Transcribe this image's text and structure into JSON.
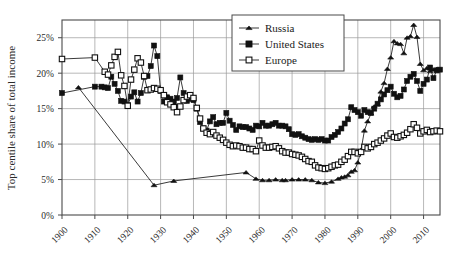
{
  "chart_data": {
    "type": "line",
    "title": "",
    "xlabel": "",
    "ylabel": "Top centile share of total income",
    "xlim": [
      1900,
      2015
    ],
    "ylim": [
      0,
      27.5
    ],
    "grid": true,
    "legend_position": "top-center-right",
    "x_tick_labels": [
      "1900",
      "1910",
      "1920",
      "1930",
      "1940",
      "1950",
      "1960",
      "1970",
      "1980",
      "1990",
      "2000",
      "2010"
    ],
    "x_ticks": [
      1900,
      1910,
      1920,
      1930,
      1940,
      1950,
      1960,
      1970,
      1980,
      1990,
      2000,
      2010
    ],
    "y_tick_labels": [
      "0%",
      "5%",
      "10%",
      "15%",
      "20%",
      "25%"
    ],
    "y_ticks": [
      0,
      5,
      10,
      15,
      20,
      25
    ],
    "series": [
      {
        "name": "Russia",
        "marker": "filled-triangle",
        "points": [
          [
            1905,
            18.0
          ],
          [
            1928,
            4.2
          ],
          [
            1934,
            4.8
          ],
          [
            1956,
            6.0
          ],
          [
            1959,
            5.1
          ],
          [
            1961,
            4.9
          ],
          [
            1963,
            4.9
          ],
          [
            1965,
            5.0
          ],
          [
            1967,
            4.9
          ],
          [
            1968,
            4.9
          ],
          [
            1970,
            5.0
          ],
          [
            1972,
            5.0
          ],
          [
            1974,
            5.0
          ],
          [
            1976,
            4.9
          ],
          [
            1978,
            4.6
          ],
          [
            1980,
            4.5
          ],
          [
            1982,
            4.7
          ],
          [
            1984,
            5.1
          ],
          [
            1985,
            5.3
          ],
          [
            1986,
            5.4
          ],
          [
            1987,
            5.6
          ],
          [
            1988,
            6.1
          ],
          [
            1989,
            6.3
          ],
          [
            1990,
            7.4
          ],
          [
            1991,
            9.2
          ],
          [
            1992,
            11.9
          ],
          [
            1993,
            13.2
          ],
          [
            1994,
            14.3
          ],
          [
            1995,
            15.3
          ],
          [
            1996,
            15.6
          ],
          [
            1997,
            17.4
          ],
          [
            1998,
            18.6
          ],
          [
            1999,
            20.6
          ],
          [
            2000,
            22.2
          ],
          [
            2001,
            24.5
          ],
          [
            2002,
            24.2
          ],
          [
            2003,
            24.1
          ],
          [
            2004,
            22.8
          ],
          [
            2005,
            25.0
          ],
          [
            2006,
            25.2
          ],
          [
            2007,
            26.8
          ],
          [
            2008,
            25.1
          ],
          [
            2009,
            21.3
          ],
          [
            2010,
            20.4
          ],
          [
            2011,
            20.7
          ],
          [
            2012,
            20.3
          ],
          [
            2013,
            20.5
          ],
          [
            2014,
            20.6
          ]
        ]
      },
      {
        "name": "United States",
        "marker": "filled-square",
        "points": [
          [
            1900,
            17.2
          ],
          [
            1910,
            18.1
          ],
          [
            1912,
            18.1
          ],
          [
            1913,
            18.0
          ],
          [
            1914,
            17.9
          ],
          [
            1915,
            19.5
          ],
          [
            1916,
            18.5
          ],
          [
            1917,
            17.5
          ],
          [
            1918,
            16.1
          ],
          [
            1919,
            16.0
          ],
          [
            1920,
            15.5
          ],
          [
            1921,
            16.7
          ],
          [
            1922,
            17.3
          ],
          [
            1923,
            16.0
          ],
          [
            1924,
            17.2
          ],
          [
            1925,
            19.5
          ],
          [
            1926,
            19.6
          ],
          [
            1927,
            21.0
          ],
          [
            1928,
            23.9
          ],
          [
            1929,
            22.4
          ],
          [
            1930,
            17.5
          ],
          [
            1931,
            16.0
          ],
          [
            1932,
            16.6
          ],
          [
            1933,
            16.4
          ],
          [
            1934,
            16.0
          ],
          [
            1935,
            16.5
          ],
          [
            1936,
            19.4
          ],
          [
            1937,
            17.2
          ],
          [
            1938,
            16.1
          ],
          [
            1939,
            16.4
          ],
          [
            1940,
            16.2
          ],
          [
            1941,
            15.0
          ],
          [
            1942,
            13.1
          ],
          [
            1943,
            12.2
          ],
          [
            1944,
            11.9
          ],
          [
            1945,
            13.2
          ],
          [
            1946,
            13.8
          ],
          [
            1947,
            12.8
          ],
          [
            1948,
            13.0
          ],
          [
            1949,
            13.0
          ],
          [
            1950,
            14.4
          ],
          [
            1951,
            13.3
          ],
          [
            1952,
            12.7
          ],
          [
            1953,
            12.0
          ],
          [
            1954,
            12.5
          ],
          [
            1955,
            12.4
          ],
          [
            1956,
            12.4
          ],
          [
            1957,
            12.2
          ],
          [
            1958,
            12.0
          ],
          [
            1959,
            12.6
          ],
          [
            1960,
            12.5
          ],
          [
            1961,
            13.0
          ],
          [
            1962,
            12.6
          ],
          [
            1963,
            12.6
          ],
          [
            1964,
            12.8
          ],
          [
            1965,
            13.0
          ],
          [
            1966,
            12.6
          ],
          [
            1967,
            12.6
          ],
          [
            1968,
            12.5
          ],
          [
            1969,
            12.1
          ],
          [
            1970,
            11.4
          ],
          [
            1971,
            11.3
          ],
          [
            1972,
            11.4
          ],
          [
            1973,
            11.1
          ],
          [
            1974,
            10.9
          ],
          [
            1975,
            10.7
          ],
          [
            1976,
            10.6
          ],
          [
            1977,
            10.7
          ],
          [
            1978,
            10.6
          ],
          [
            1979,
            10.7
          ],
          [
            1980,
            10.5
          ],
          [
            1981,
            10.5
          ],
          [
            1982,
            11.0
          ],
          [
            1983,
            11.3
          ],
          [
            1984,
            11.7
          ],
          [
            1985,
            12.2
          ],
          [
            1986,
            12.9
          ],
          [
            1987,
            13.5
          ],
          [
            1988,
            15.2
          ],
          [
            1989,
            14.8
          ],
          [
            1990,
            14.5
          ],
          [
            1991,
            14.0
          ],
          [
            1992,
            14.8
          ],
          [
            1993,
            14.5
          ],
          [
            1994,
            14.4
          ],
          [
            1995,
            15.0
          ],
          [
            1996,
            15.7
          ],
          [
            1997,
            16.3
          ],
          [
            1998,
            17.0
          ],
          [
            1999,
            17.6
          ],
          [
            2000,
            18.1
          ],
          [
            2001,
            17.1
          ],
          [
            2002,
            16.6
          ],
          [
            2003,
            16.8
          ],
          [
            2004,
            17.7
          ],
          [
            2005,
            18.9
          ],
          [
            2006,
            19.5
          ],
          [
            2007,
            19.9
          ],
          [
            2008,
            18.9
          ],
          [
            2009,
            17.5
          ],
          [
            2010,
            18.5
          ],
          [
            2011,
            19.1
          ],
          [
            2012,
            20.8
          ],
          [
            2013,
            19.3
          ],
          [
            2014,
            20.4
          ],
          [
            2015,
            20.5
          ]
        ]
      },
      {
        "name": "Europe",
        "marker": "open-square",
        "points": [
          [
            1900,
            22.0
          ],
          [
            1910,
            22.2
          ],
          [
            1913,
            20.2
          ],
          [
            1914,
            19.8
          ],
          [
            1915,
            21.1
          ],
          [
            1916,
            22.3
          ],
          [
            1917,
            23.0
          ],
          [
            1918,
            19.7
          ],
          [
            1919,
            18.2
          ],
          [
            1920,
            15.4
          ],
          [
            1921,
            19.1
          ],
          [
            1922,
            20.5
          ],
          [
            1923,
            22.1
          ],
          [
            1924,
            21.5
          ],
          [
            1925,
            19.6
          ],
          [
            1926,
            17.6
          ],
          [
            1927,
            17.7
          ],
          [
            1928,
            17.9
          ],
          [
            1929,
            17.8
          ],
          [
            1930,
            17.6
          ],
          [
            1931,
            16.9
          ],
          [
            1932,
            15.9
          ],
          [
            1933,
            15.6
          ],
          [
            1934,
            15.2
          ],
          [
            1935,
            14.5
          ],
          [
            1936,
            15.3
          ],
          [
            1937,
            16.2
          ],
          [
            1938,
            16.7
          ],
          [
            1939,
            16.9
          ],
          [
            1940,
            16.5
          ],
          [
            1941,
            15.1
          ],
          [
            1942,
            13.6
          ],
          [
            1943,
            12.2
          ],
          [
            1944,
            11.6
          ],
          [
            1945,
            11.4
          ],
          [
            1946,
            11.7
          ],
          [
            1947,
            11.2
          ],
          [
            1948,
            10.9
          ],
          [
            1949,
            10.6
          ],
          [
            1950,
            10.2
          ],
          [
            1951,
            9.9
          ],
          [
            1952,
            9.7
          ],
          [
            1953,
            9.8
          ],
          [
            1954,
            9.7
          ],
          [
            1955,
            9.5
          ],
          [
            1956,
            9.5
          ],
          [
            1957,
            9.3
          ],
          [
            1958,
            9.3
          ],
          [
            1959,
            9.0
          ],
          [
            1960,
            10.5
          ],
          [
            1961,
            9.8
          ],
          [
            1962,
            9.5
          ],
          [
            1963,
            9.5
          ],
          [
            1964,
            9.6
          ],
          [
            1965,
            9.7
          ],
          [
            1966,
            9.4
          ],
          [
            1967,
            9.0
          ],
          [
            1968,
            8.8
          ],
          [
            1969,
            8.8
          ],
          [
            1970,
            8.6
          ],
          [
            1971,
            8.5
          ],
          [
            1972,
            8.4
          ],
          [
            1973,
            8.2
          ],
          [
            1974,
            7.9
          ],
          [
            1975,
            7.6
          ],
          [
            1976,
            7.5
          ],
          [
            1977,
            7.0
          ],
          [
            1978,
            6.7
          ],
          [
            1979,
            6.6
          ],
          [
            1980,
            6.5
          ],
          [
            1981,
            6.6
          ],
          [
            1982,
            6.8
          ],
          [
            1983,
            7.0
          ],
          [
            1984,
            7.1
          ],
          [
            1985,
            7.5
          ],
          [
            1986,
            7.8
          ],
          [
            1987,
            8.3
          ],
          [
            1988,
            8.9
          ],
          [
            1989,
            8.9
          ],
          [
            1990,
            8.7
          ],
          [
            1991,
            8.9
          ],
          [
            1992,
            9.6
          ],
          [
            1993,
            9.4
          ],
          [
            1994,
            9.6
          ],
          [
            1995,
            10.0
          ],
          [
            1996,
            10.2
          ],
          [
            1997,
            10.5
          ],
          [
            1998,
            10.8
          ],
          [
            1999,
            11.2
          ],
          [
            2000,
            11.5
          ],
          [
            2001,
            11.0
          ],
          [
            2002,
            10.9
          ],
          [
            2003,
            11.1
          ],
          [
            2004,
            11.3
          ],
          [
            2005,
            11.6
          ],
          [
            2006,
            12.1
          ],
          [
            2007,
            12.8
          ],
          [
            2008,
            12.3
          ],
          [
            2009,
            11.5
          ],
          [
            2010,
            11.8
          ],
          [
            2011,
            12.0
          ],
          [
            2012,
            11.7
          ],
          [
            2013,
            11.8
          ],
          [
            2014,
            11.9
          ],
          [
            2015,
            11.8
          ]
        ]
      }
    ]
  },
  "legend": {
    "items": [
      {
        "label": "Russia",
        "marker": "filled-triangle"
      },
      {
        "label": "United States",
        "marker": "filled-square"
      },
      {
        "label": "Europe",
        "marker": "open-square"
      }
    ]
  },
  "colors": {
    "series_stroke": "#171717",
    "grid": "#9a9a9a",
    "frame": "#4a4a4a",
    "text": "#2a2a2a",
    "background": "#ffffff"
  }
}
